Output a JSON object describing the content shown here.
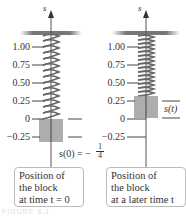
{
  "figure": {
    "axis_label": "s",
    "tick_labels": [
      "1.00",
      "0.75",
      "0.50",
      "0.25",
      "0",
      "−0.25"
    ],
    "left_panel": {
      "equation": "s(0) = −",
      "fraction_num": "1",
      "fraction_den": "4",
      "caption_lines": [
        "Position of",
        "the block",
        "at time t = 0"
      ]
    },
    "right_panel": {
      "position_label": "s(t)",
      "caption_lines": [
        "Position of",
        "the block",
        "at a later time t"
      ]
    },
    "figure_caption": "FIGURE 6.1"
  }
}
